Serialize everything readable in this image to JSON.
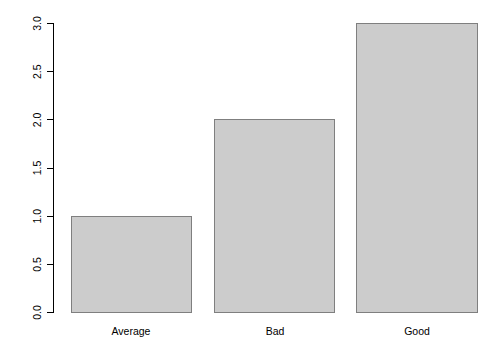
{
  "chart_data": {
    "type": "bar",
    "title": "",
    "subtitle": "",
    "xlabel": "",
    "ylabel": "",
    "categories": [
      "Average",
      "Bad",
      "Good"
    ],
    "values": [
      1.0,
      2.0,
      3.0
    ],
    "series": [
      {
        "name": "",
        "values": [
          1.0,
          2.0,
          3.0
        ]
      }
    ],
    "ylim": [
      0.0,
      3.0
    ],
    "y_ticks": [
      0.0,
      0.5,
      1.0,
      1.5,
      2.0,
      2.5,
      3.0
    ],
    "y_tick_labels": [
      "0.0",
      "0.5",
      "1.0",
      "1.5",
      "2.0",
      "2.5",
      "3.0"
    ],
    "y_tick_label_rotation": 90,
    "grid": false,
    "legend": false,
    "legend_position": "none",
    "annotations": [],
    "style": {
      "background_color": "#ffffff",
      "bar_fill_color": "#cccccc",
      "bar_border_color": "#7f7f7f",
      "axis_color": "#000000",
      "text_color": "#000000"
    }
  },
  "axis": {
    "y_axis_name": "y-axis",
    "x_axis_name": "x-axis"
  }
}
